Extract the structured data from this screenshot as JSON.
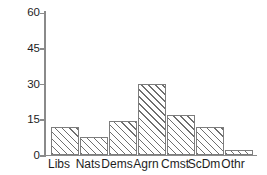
{
  "chart_data": {
    "type": "bar",
    "title": "",
    "subtitle": "",
    "xlabel": "",
    "ylabel": "",
    "categories": [
      "Libs",
      "Nats",
      "Dems",
      "Agrn",
      "Cmst",
      "ScDm",
      "Othr"
    ],
    "values": [
      12,
      7.5,
      14.5,
      30,
      17,
      12,
      2
    ],
    "series": [
      {
        "name": "",
        "values": [
          12,
          7.5,
          14.5,
          30,
          17,
          12,
          2
        ]
      }
    ],
    "ylim": [
      0,
      60
    ],
    "yticks": [
      0,
      15,
      30,
      45,
      60
    ],
    "ytick_labels": [
      "0",
      "15",
      "30",
      "45",
      "60"
    ],
    "grid": false,
    "legend": false,
    "legend_position": "none",
    "bar_fill": "diagonal-hatch",
    "annotations": []
  },
  "style": {
    "axis_color": "#8a8a8a",
    "bar_edge_color": "#7d7d7d",
    "hatch_color": "#6f6f6f",
    "text_color": "#1d1d1d",
    "background": "#ffffff"
  }
}
